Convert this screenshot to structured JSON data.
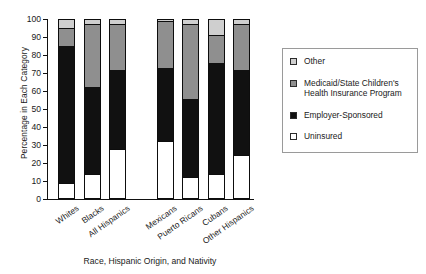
{
  "chart_data": {
    "type": "bar",
    "subtype": "stacked-bar-100",
    "title": "",
    "xlabel": "Race, Hispanic Origin, and Nativity",
    "ylabel": "Percentage in Each Category",
    "ylim": [
      0,
      100
    ],
    "yticks": [
      0,
      10,
      20,
      30,
      40,
      50,
      60,
      70,
      80,
      90,
      100
    ],
    "grid": false,
    "legend_position": "right",
    "categories": [
      "Whites",
      "Blacks",
      "All Hispanics",
      "Mexicans",
      "Puerto Ricans",
      "Cubans",
      "Other Hispanics"
    ],
    "group_gap_after_index": 2,
    "series": [
      {
        "name": "Uninsured",
        "color": "#ffffff",
        "values": [
          9,
          14,
          28,
          32,
          12,
          14,
          24.5
        ]
      },
      {
        "name": "Employer-Sponsored",
        "color": "#111111",
        "values": [
          76,
          48.5,
          43.5,
          41,
          43.5,
          61.5,
          47
        ]
      },
      {
        "name": "Medicaid/State Children's Health Insurance Program",
        "color": "#8f8f8f",
        "values": [
          10,
          34.5,
          26,
          26,
          41.5,
          15.5,
          26
        ]
      },
      {
        "name": "Other",
        "color": "#cfcfcf",
        "values": [
          5,
          3,
          2.5,
          1,
          3,
          9,
          2.5
        ]
      }
    ],
    "cumulative_tops": [
      [
        9,
        85,
        95,
        100
      ],
      [
        14,
        62.5,
        97,
        100
      ],
      [
        28,
        71.5,
        97.5,
        100
      ],
      [
        32,
        73,
        99,
        100
      ],
      [
        12,
        55.5,
        97,
        100
      ],
      [
        14,
        75.5,
        91,
        100
      ],
      [
        24.5,
        71.5,
        97.5,
        100
      ]
    ]
  },
  "legend": {
    "items": [
      {
        "label": "Other",
        "swatch": "other"
      },
      {
        "label": "Medicaid/State Children's Health Insurance Program",
        "swatch": "medicaid"
      },
      {
        "label": "Employer-Sponsored",
        "swatch": "employer"
      },
      {
        "label": "Uninsured",
        "swatch": "uninsured"
      }
    ]
  }
}
